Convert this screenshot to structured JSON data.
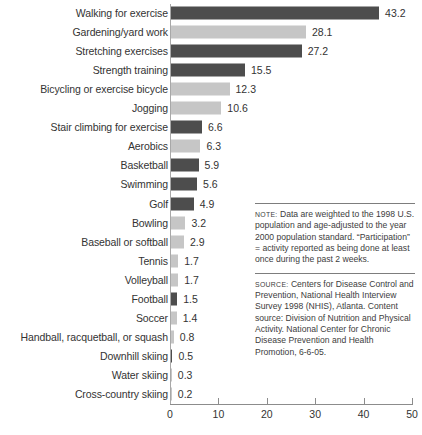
{
  "chart_data": {
    "type": "bar",
    "orientation": "horizontal",
    "title": "",
    "xlabel": "",
    "ylabel": "",
    "xlim": [
      0,
      50
    ],
    "xticks": [
      0,
      10,
      20,
      30,
      40,
      50
    ],
    "grid": false,
    "legend": null,
    "categories": [
      "Walking for exercise",
      "Gardening/yard work",
      "Stretching exercises",
      "Strength training",
      "Bicycling or exercise bicycle",
      "Jogging",
      "Stair climbing for exercise",
      "Aerobics",
      "Basketball",
      "Swimming",
      "Golf",
      "Bowling",
      "Baseball or softball",
      "Tennis",
      "Volleyball",
      "Football",
      "Soccer",
      "Handball, racquetball, or squash",
      "Downhill skiing",
      "Water skiing",
      "Cross-country skiing"
    ],
    "values": [
      43.2,
      28.1,
      27.2,
      15.5,
      12.3,
      10.6,
      6.6,
      6.3,
      5.9,
      5.6,
      4.9,
      3.2,
      2.9,
      1.7,
      1.7,
      1.5,
      1.4,
      0.8,
      0.5,
      0.3,
      0.2
    ],
    "value_labels": [
      "43.2",
      "28.1",
      "27.2",
      "15.5",
      "12.3",
      "10.6",
      "6.6",
      "6.3",
      "5.9",
      "5.6",
      "4.9",
      "3.2",
      "2.9",
      "1.7",
      "1.7",
      "1.5",
      "1.4",
      "0.8",
      "0.5",
      "0.3",
      "0.2"
    ],
    "bar_shades": [
      "dark",
      "light",
      "dark",
      "dark",
      "light",
      "light",
      "dark",
      "light",
      "dark",
      "dark",
      "dark",
      "light",
      "light",
      "light",
      "light",
      "dark",
      "light",
      "light",
      "dark",
      "light",
      "light"
    ],
    "colors": {
      "bar_dark": "#4d4d4d",
      "bar_light": "#c6c6c6",
      "axis": "#8c8c8c",
      "text": "#333333"
    }
  },
  "notes": {
    "note_lead": "NOTE:",
    "note_text": " Data are weighted to the 1998 U.S. population and age-adjusted to the year 2000 population standard. “Participation” = activity reported as being done at least once during the past 2 weeks.",
    "source_lead": "SOURCE:",
    "source_text": " Centers for Disease Control and Prevention, National Health Interview Survey 1998 (NHIS), Atlanta. Content source: Division of Nutrition and Physical Activity. National Center for Chronic Disease Prevention and Health Promotion, 6-6-05."
  }
}
